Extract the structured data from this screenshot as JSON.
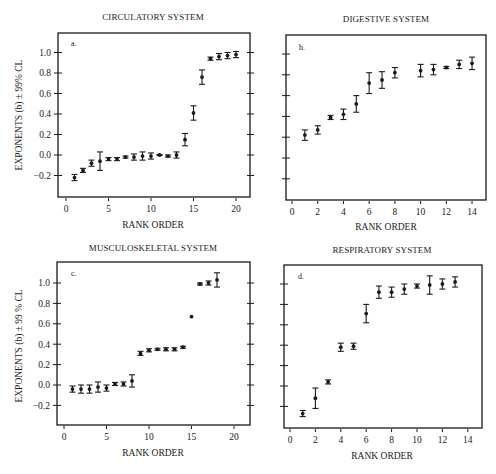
{
  "figure": {
    "ylabel": "EXPONENTS (b) ± 99% CL",
    "xlabel": "RANK ORDER"
  },
  "chart_data": [
    {
      "type": "scatter",
      "panel": "a.",
      "title": "CIRCULATORY SYSTEM",
      "xlabel": "RANK ORDER",
      "ylabel": "EXPONENTS (b) ± 99% CL",
      "xlim": [
        -1,
        22
      ],
      "ylim": [
        -0.4,
        1.15
      ],
      "xticks": [
        0,
        5,
        10,
        15,
        20
      ],
      "yticks": [
        -0.2,
        0.0,
        0.2,
        0.4,
        0.6,
        0.8,
        1.0
      ],
      "ytick_labels": [
        "-0.2",
        "0.0",
        "0.2",
        "0.4",
        "0.6",
        "0.8",
        "1.0"
      ],
      "grid": false,
      "points": [
        {
          "x": 1,
          "y": -0.22,
          "err": 0.03
        },
        {
          "x": 2,
          "y": -0.15,
          "err": 0.02
        },
        {
          "x": 3,
          "y": -0.08,
          "err": 0.03
        },
        {
          "x": 4,
          "y": -0.06,
          "err": 0.09
        },
        {
          "x": 5,
          "y": -0.04,
          "err": 0.015
        },
        {
          "x": 6,
          "y": -0.04,
          "err": 0.015
        },
        {
          "x": 7,
          "y": -0.02,
          "err": 0.01
        },
        {
          "x": 8,
          "y": -0.02,
          "err": 0.03
        },
        {
          "x": 9,
          "y": -0.01,
          "err": 0.04
        },
        {
          "x": 10,
          "y": -0.01,
          "err": 0.03
        },
        {
          "x": 11,
          "y": 0.0,
          "err": 0.005
        },
        {
          "x": 12,
          "y": -0.01,
          "err": 0.01
        },
        {
          "x": 13,
          "y": 0.0,
          "err": 0.03
        },
        {
          "x": 14,
          "y": 0.15,
          "err": 0.06
        },
        {
          "x": 15,
          "y": 0.41,
          "err": 0.07
        },
        {
          "x": 16,
          "y": 0.76,
          "err": 0.07
        },
        {
          "x": 17,
          "y": 0.94,
          "err": 0.015
        },
        {
          "x": 18,
          "y": 0.96,
          "err": 0.03
        },
        {
          "x": 19,
          "y": 0.97,
          "err": 0.03
        },
        {
          "x": 20,
          "y": 0.98,
          "err": 0.03
        }
      ]
    },
    {
      "type": "scatter",
      "panel": "b.",
      "title": "DIGESTIVE SYSTEM",
      "xlabel": "RANK ORDER",
      "ylabel": "",
      "xlim": [
        -0.5,
        15
      ],
      "ylim": [
        -0.4,
        1.15
      ],
      "xticks": [
        0,
        2,
        4,
        6,
        8,
        10,
        12,
        14
      ],
      "yticks": [
        -0.2,
        0.0,
        0.2,
        0.4,
        0.6,
        0.8,
        1.0
      ],
      "ytick_labels": [],
      "grid": false,
      "points": [
        {
          "x": 1,
          "y": 0.22,
          "err": 0.05
        },
        {
          "x": 2,
          "y": 0.27,
          "err": 0.04
        },
        {
          "x": 3,
          "y": 0.39,
          "err": 0.02
        },
        {
          "x": 4,
          "y": 0.42,
          "err": 0.05
        },
        {
          "x": 5,
          "y": 0.52,
          "err": 0.08
        },
        {
          "x": 6,
          "y": 0.72,
          "err": 0.1
        },
        {
          "x": 7,
          "y": 0.75,
          "err": 0.08
        },
        {
          "x": 8,
          "y": 0.82,
          "err": 0.05
        },
        {
          "x": 10,
          "y": 0.84,
          "err": 0.06
        },
        {
          "x": 11,
          "y": 0.85,
          "err": 0.05
        },
        {
          "x": 12,
          "y": 0.87,
          "err": 0.01
        },
        {
          "x": 13,
          "y": 0.9,
          "err": 0.04
        },
        {
          "x": 14,
          "y": 0.91,
          "err": 0.06
        }
      ]
    },
    {
      "type": "scatter",
      "panel": "c.",
      "title": "MUSCULOSKELETAL SYSTEM",
      "xlabel": "RANK ORDER",
      "ylabel": "EXPONENTS (b) ± 99 % CL",
      "xlim": [
        -1,
        22
      ],
      "ylim": [
        -0.4,
        1.15
      ],
      "xticks": [
        0,
        5,
        10,
        15,
        20
      ],
      "yticks": [
        -0.2,
        0.0,
        0.2,
        0.4,
        0.6,
        0.8,
        1.0
      ],
      "ytick_labels": [
        "-0.2",
        "0.0",
        "0.2",
        "0.4",
        "0.6",
        "0.8",
        "1.0"
      ],
      "grid": false,
      "points": [
        {
          "x": 1,
          "y": -0.04,
          "err": 0.03
        },
        {
          "x": 2,
          "y": -0.04,
          "err": 0.04
        },
        {
          "x": 3,
          "y": -0.04,
          "err": 0.04
        },
        {
          "x": 4,
          "y": -0.02,
          "err": 0.05
        },
        {
          "x": 5,
          "y": -0.03,
          "err": 0.03
        },
        {
          "x": 6,
          "y": 0.01,
          "err": 0.015
        },
        {
          "x": 7,
          "y": 0.01,
          "err": 0.02
        },
        {
          "x": 8,
          "y": 0.04,
          "err": 0.06
        },
        {
          "x": 9,
          "y": 0.31,
          "err": 0.02
        },
        {
          "x": 10,
          "y": 0.34,
          "err": 0.015
        },
        {
          "x": 11,
          "y": 0.35,
          "err": 0.01
        },
        {
          "x": 12,
          "y": 0.35,
          "err": 0.015
        },
        {
          "x": 13,
          "y": 0.35,
          "err": 0.015
        },
        {
          "x": 14,
          "y": 0.37,
          "err": 0.01
        },
        {
          "x": 15,
          "y": 0.67,
          "err": 0.0
        },
        {
          "x": 16,
          "y": 0.99,
          "err": 0.01
        },
        {
          "x": 17,
          "y": 1.0,
          "err": 0.02
        },
        {
          "x": 18,
          "y": 1.03,
          "err": 0.07
        }
      ]
    },
    {
      "type": "scatter",
      "panel": "d.",
      "title": "RESPIRATORY SYSTEM",
      "xlabel": "RANK ORDER",
      "ylabel": "",
      "xlim": [
        -0.5,
        15
      ],
      "ylim": [
        -0.4,
        1.15
      ],
      "xticks": [
        0,
        2,
        4,
        6,
        8,
        10,
        12,
        14
      ],
      "yticks": [
        -0.2,
        0.0,
        0.2,
        0.4,
        0.6,
        0.8,
        1.0
      ],
      "ytick_labels": [],
      "grid": false,
      "points": [
        {
          "x": 1,
          "y": -0.27,
          "err": 0.03
        },
        {
          "x": 2,
          "y": -0.12,
          "err": 0.1
        },
        {
          "x": 3,
          "y": 0.04,
          "err": 0.02
        },
        {
          "x": 4,
          "y": 0.38,
          "err": 0.04
        },
        {
          "x": 5,
          "y": 0.39,
          "err": 0.03
        },
        {
          "x": 6,
          "y": 0.71,
          "err": 0.09
        },
        {
          "x": 7,
          "y": 0.92,
          "err": 0.06
        },
        {
          "x": 8,
          "y": 0.92,
          "err": 0.05
        },
        {
          "x": 9,
          "y": 0.95,
          "err": 0.05
        },
        {
          "x": 10,
          "y": 0.98,
          "err": 0.02
        },
        {
          "x": 11,
          "y": 0.99,
          "err": 0.09
        },
        {
          "x": 12,
          "y": 1.0,
          "err": 0.05
        },
        {
          "x": 13,
          "y": 1.02,
          "err": 0.05
        }
      ]
    }
  ],
  "layout": {
    "panels": [
      {
        "frame": [
          58,
          33,
          250,
          197
        ],
        "x0": 66,
        "xpx": 8.5,
        "y0": 155,
        "ypx": 102.5,
        "title_xy": [
          153,
          20
        ],
        "letter_xy": [
          71,
          46
        ],
        "ylabel_xy": [
          22,
          115
        ],
        "xlabel_xy": [
          153,
          228
        ],
        "show_yticklabels": true,
        "tick_side": "left",
        "ytick_right": true
      },
      {
        "frame": [
          286,
          35,
          486,
          200
        ],
        "x0": 292,
        "xpx": 12.86,
        "y0": 158,
        "ypx": 104,
        "title_xy": [
          386,
          22
        ],
        "letter_xy": [
          299,
          50
        ],
        "xlabel_xy": [
          386,
          230
        ],
        "show_yticklabels": false,
        "tick_side": "left",
        "ytick_right": false
      },
      {
        "frame": [
          57,
          262,
          250,
          425
        ],
        "x0": 64,
        "xpx": 8.5,
        "y0": 385,
        "ypx": 102,
        "title_xy": [
          153,
          251
        ],
        "letter_xy": [
          71,
          276
        ],
        "ylabel_xy": [
          22,
          346
        ],
        "xlabel_xy": [
          153,
          456
        ],
        "show_yticklabels": true,
        "tick_side": "left",
        "ytick_right": true
      },
      {
        "frame": [
          284,
          265,
          482,
          428
        ],
        "x0": 290,
        "xpx": 12.7,
        "y0": 386,
        "ypx": 102,
        "title_xy": [
          382,
          253
        ],
        "letter_xy": [
          298,
          279
        ],
        "xlabel_xy": [
          382,
          459
        ],
        "show_yticklabels": false,
        "tick_side": "left",
        "ytick_right": false
      }
    ]
  }
}
